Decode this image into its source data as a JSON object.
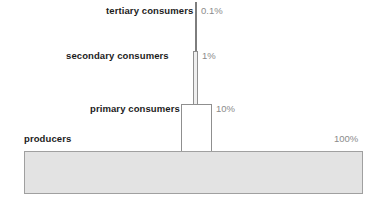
{
  "diagram": {
    "levels": [
      {
        "id": "tertiary",
        "label": "tertiary consumers",
        "percent_label": "0.1%",
        "percent_value": 0.1
      },
      {
        "id": "secondary",
        "label": "secondary consumers",
        "percent_label": "1%",
        "percent_value": 1
      },
      {
        "id": "primary",
        "label": "primary consumers",
        "percent_label": "10%",
        "percent_value": 10
      },
      {
        "id": "producers",
        "label": "producers",
        "percent_label": "100%",
        "percent_value": 100
      }
    ],
    "colors": {
      "bar_fill": "#e3e3e3",
      "bar_fill_light": "#ffffff",
      "bar_stroke": "#9a9a9a",
      "label_text": "#1c1c1c",
      "percent_text": "#8b8b8b",
      "background": "#ffffff"
    }
  },
  "chart_data": {
    "type": "bar",
    "title": "",
    "xlabel": "",
    "ylabel": "",
    "categories": [
      "producers",
      "primary consumers",
      "secondary consumers",
      "tertiary consumers"
    ],
    "values": [
      100,
      10,
      1,
      0.1
    ],
    "value_labels": [
      "100%",
      "10%",
      "1%",
      "0.1%"
    ],
    "orientation": "vertical-stack",
    "grid": false,
    "legend": "none",
    "note": "Widths of stacked bars are proportional to relative energy at each trophic level."
  }
}
